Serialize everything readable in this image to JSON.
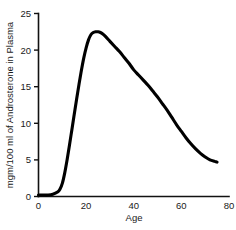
{
  "chart_data": {
    "type": "line",
    "title": "",
    "xlabel": "Age",
    "ylabel": "mgm/100 ml of Androsterone in Plasma",
    "xlim": [
      0,
      80
    ],
    "ylim": [
      0,
      25
    ],
    "xticks": [
      0,
      20,
      40,
      60,
      80
    ],
    "yticks": [
      0,
      5,
      10,
      15,
      20,
      25
    ],
    "xtick_labels": [
      "0",
      "20",
      "40",
      "60",
      "80"
    ],
    "ytick_labels": [
      "0",
      "5",
      "10",
      "15",
      "20",
      "25"
    ],
    "grid": false,
    "legend": null,
    "series": [
      {
        "name": "Androsterone in Plasma",
        "color": "#000000",
        "x": [
          0,
          2,
          4,
          6,
          8,
          9,
          10,
          11,
          12,
          13,
          14,
          15,
          16,
          17,
          18,
          19,
          20,
          21,
          22,
          23,
          24,
          25,
          26,
          27,
          28,
          30,
          32,
          34,
          36,
          38,
          40,
          42,
          44,
          46,
          48,
          50,
          52,
          54,
          56,
          58,
          60,
          62,
          64,
          66,
          68,
          70,
          72,
          74,
          75
        ],
        "y": [
          0.2,
          0.2,
          0.2,
          0.3,
          0.6,
          1.0,
          1.8,
          3.2,
          5.0,
          7.0,
          9.1,
          11.2,
          13.3,
          15.3,
          17.2,
          18.9,
          20.3,
          21.4,
          22.1,
          22.4,
          22.5,
          22.5,
          22.4,
          22.2,
          21.9,
          21.2,
          20.5,
          19.8,
          19.0,
          18.2,
          17.3,
          16.6,
          15.9,
          15.2,
          14.4,
          13.6,
          12.7,
          11.8,
          10.8,
          9.8,
          8.9,
          8.0,
          7.2,
          6.5,
          5.9,
          5.4,
          5.0,
          4.8,
          4.7
        ]
      }
    ],
    "annotations": {
      "peak_value": 22.5,
      "peak_age": 25,
      "onset_age": 8,
      "end_age": 75,
      "end_value": 4.7
    },
    "colors": {
      "curve": "#000000",
      "axis": "#111111",
      "text": "#1a1a1a",
      "background": "#ffffff"
    }
  }
}
